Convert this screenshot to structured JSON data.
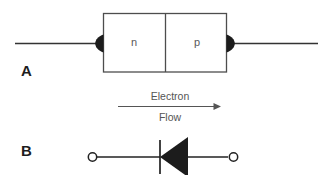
{
  "figure": {
    "background_color": "#ffffff",
    "panels": [
      {
        "id": "A",
        "label": "A",
        "description": "pn junction with n and p regions and metal contacts"
      },
      {
        "id": "B",
        "label": "B",
        "description": "diode circuit symbol with two terminals"
      }
    ]
  },
  "panel_a": {
    "label": "A",
    "regions": [
      {
        "name": "n-region",
        "label": "n"
      },
      {
        "name": "p-region",
        "label": "p"
      }
    ],
    "left_lead": {
      "name": "left-lead"
    },
    "right_lead": {
      "name": "right-lead"
    },
    "left_contact": {
      "name": "left-contact"
    },
    "right_contact": {
      "name": "right-contact"
    },
    "box_stroke": "#4d4d4d",
    "lead_stroke": "#333333"
  },
  "flow_annotation": {
    "line1": "Electron",
    "line2": "Flow",
    "direction": "right",
    "arrow_color": "#555555",
    "text_color": "#555555"
  },
  "panel_b": {
    "label": "B",
    "symbol": "diode",
    "triangle_direction": "left",
    "terminals": [
      {
        "name": "left-terminal"
      },
      {
        "name": "right-terminal"
      }
    ],
    "cathode_bar": {
      "name": "cathode-bar"
    },
    "stroke": "#222222",
    "fill": "#1c1c1c"
  },
  "colors": {
    "ink": "#1d1d1d",
    "gray_text": "#555555",
    "box_stroke": "#4d4d4d",
    "background": "#ffffff"
  }
}
